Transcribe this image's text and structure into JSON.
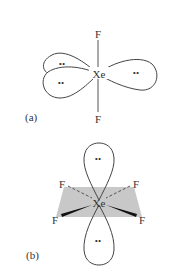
{
  "figure_a": {
    "label": "(a)",
    "center_atom": "Xe",
    "top_atom": "F",
    "bottom_atom": "F",
    "lone_pair": "••",
    "lone_pair_count": 3
  },
  "figure_b": {
    "label": "(b)",
    "center_atom": "Xe",
    "ligands": [
      "F",
      "F",
      "F",
      "F"
    ],
    "lone_pair": "••",
    "lone_pair_count": 2
  },
  "colors": {
    "background": "#ffffff",
    "line": "#444444",
    "plane": "#c8c8c8",
    "text": "#333333"
  }
}
